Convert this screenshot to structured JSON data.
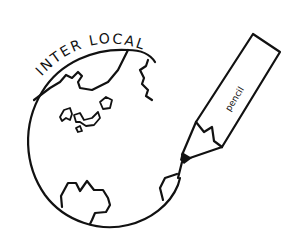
{
  "logo": {
    "title": "INTER LOCAL",
    "pencil_label": "pencil",
    "colors": {
      "ink": "#111111",
      "background": "#ffffff"
    },
    "elements": [
      "globe-icon",
      "pencil-icon",
      "continents"
    ]
  }
}
